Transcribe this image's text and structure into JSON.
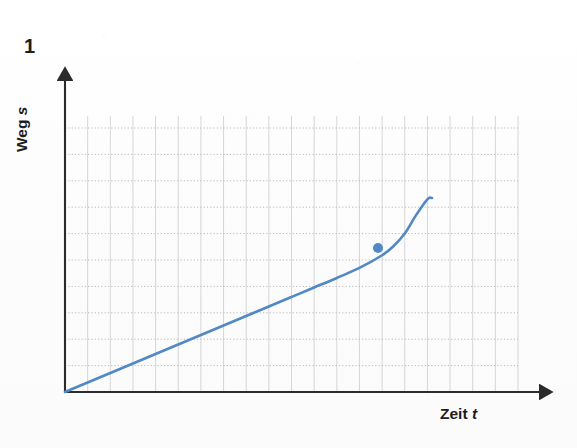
{
  "figure": {
    "number": "1",
    "background_color": "#fdfdfd"
  },
  "axes": {
    "y_label_text": "Weg",
    "y_label_variable": "s",
    "x_label_text": "Zeit",
    "x_label_variable": "t",
    "axis_color": "#2b2b2b",
    "origin_px": {
      "x": 65,
      "y": 392
    },
    "y_axis_top_px": 72,
    "x_axis_right_px": 548
  },
  "grid": {
    "color_horizontal": "#b9b9b9",
    "color_vertical": "#cfcfcf",
    "style_horizontal": "dotted",
    "style_vertical": "solid",
    "left_px": 65,
    "right_px": 518,
    "top_px": 128,
    "bottom_px": 392,
    "vertical_spacing_px": 22.65,
    "horizontal_spacing_px": 26.4,
    "vertical_line_count": 21,
    "horizontal_line_count": 11
  },
  "chart_data": {
    "type": "line",
    "title": "",
    "xlabel": "Zeit t",
    "ylabel": "Weg s",
    "xlim": [
      0,
      20
    ],
    "ylim": [
      0,
      10
    ],
    "grid": true,
    "legend": null,
    "axis_ticks": "none",
    "series": [
      {
        "name": "Weg-Zeit-Kurve",
        "color": "#5189c4",
        "line_width": 2.6,
        "description": "nahezu lineare Zunahme, am Ende steiler Anstieg",
        "x": [
          0.0,
          1.0,
          2.0,
          3.0,
          4.0,
          5.0,
          6.0,
          7.0,
          8.0,
          9.0,
          10.0,
          11.0,
          12.0,
          13.0,
          14.0,
          14.5,
          15.0,
          15.5,
          16.0,
          16.2
        ],
        "y": [
          0.0,
          0.36,
          0.72,
          1.08,
          1.44,
          1.8,
          2.16,
          2.52,
          2.88,
          3.24,
          3.6,
          3.96,
          4.32,
          4.7,
          5.18,
          5.52,
          6.0,
          6.7,
          7.3,
          7.35
        ]
      }
    ],
    "markers": [
      {
        "name": "data-point",
        "x": 13.8,
        "y": 5.45,
        "px": {
          "x": 378,
          "y": 248
        },
        "radius_px": 5,
        "color": "#5189c4"
      }
    ]
  },
  "colors": {
    "curve": "#5189c4",
    "marker": "#5189c4",
    "axis": "#2b2b2b",
    "grid_h": "#b9b9b9",
    "grid_v": "#cfcfcf",
    "text": "#1d1d1d"
  }
}
